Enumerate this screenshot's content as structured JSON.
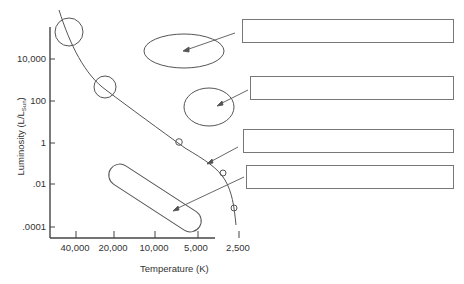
{
  "diagram": {
    "y_axis": {
      "label": "Luminosity (L/L",
      "label_sub": "Sun",
      "label_close": ")",
      "ticks": [
        "10,000",
        "100",
        "1",
        ".01",
        ".0001"
      ]
    },
    "x_axis": {
      "label": "Temperature (K)",
      "ticks": [
        "40,000",
        "20,000",
        "10,000",
        "5,000",
        "2,500"
      ]
    },
    "regions": [
      {
        "name": "supergiants",
        "shape": "ellipse"
      },
      {
        "name": "giants",
        "shape": "ellipse"
      },
      {
        "name": "main-sequence",
        "shape": "curve"
      },
      {
        "name": "white-dwarfs",
        "shape": "capsule"
      }
    ],
    "answer_boxes": [
      {
        "id": 1,
        "value": ""
      },
      {
        "id": 2,
        "value": ""
      },
      {
        "id": 3,
        "value": ""
      },
      {
        "id": 4,
        "value": ""
      }
    ],
    "colors": {
      "line": "#555555",
      "box_border": "#777777",
      "background": "#ffffff"
    }
  }
}
